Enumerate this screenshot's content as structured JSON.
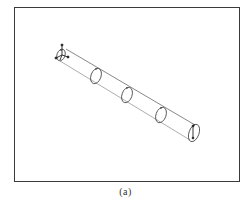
{
  "figure": {
    "caption": "(a)",
    "frame": {
      "x": 14,
      "y": 7,
      "width": 226,
      "height": 175,
      "stroke": "#3a3a3a"
    },
    "line_color": "#555555",
    "tube": {
      "top_line": {
        "x1": 66,
        "y1": 49,
        "x2": 195,
        "y2": 125
      },
      "bottom_line": {
        "x1": 60,
        "y1": 61,
        "x2": 190,
        "y2": 140
      }
    },
    "origin_triad": {
      "center": {
        "x": 62,
        "y": 55
      },
      "axes": [
        "x-axis",
        "y-axis",
        "z-axis"
      ]
    },
    "cross_sections": [
      {
        "label": "end-section-start",
        "cx": 61,
        "cy": 55,
        "rx": 4,
        "ry": 6
      },
      {
        "label": "section-1",
        "cx": 96,
        "cy": 76,
        "rx": 5,
        "ry": 8
      },
      {
        "label": "section-2",
        "cx": 127,
        "cy": 95,
        "rx": 5,
        "ry": 8
      },
      {
        "label": "section-3",
        "cx": 161,
        "cy": 115,
        "rx": 5,
        "ry": 8
      },
      {
        "label": "end-section-end",
        "cx": 194,
        "cy": 133,
        "rx": 5,
        "ry": 9
      }
    ]
  }
}
